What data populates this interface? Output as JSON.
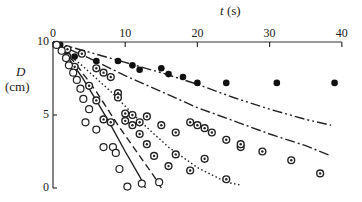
{
  "chart_data": {
    "type": "scatter",
    "title": "",
    "xlabel": "t (s)",
    "xlabel_var": "t",
    "xlabel_unit": "(s)",
    "ylabel": "D (cm)",
    "ylabel_var": "D",
    "ylabel_unit": "(cm)",
    "xlim": [
      0,
      40
    ],
    "ylim": [
      0,
      10
    ],
    "x_ticks": [
      0,
      10,
      20,
      30,
      40
    ],
    "y_ticks": [
      0,
      5,
      10
    ],
    "x_axis_position": "top",
    "grid": false,
    "legend": "none",
    "series": [
      {
        "name": "solid dots",
        "marker": "filled-circle",
        "points": [
          [
            1,
            9.8
          ],
          [
            3,
            9.0
          ],
          [
            6,
            8.7
          ],
          [
            9,
            8.7
          ],
          [
            11,
            8.4
          ],
          [
            12,
            8.1
          ],
          [
            15,
            8.2
          ],
          [
            16,
            7.8
          ],
          [
            18,
            7.6
          ],
          [
            20,
            7.2
          ],
          [
            24,
            7.2
          ],
          [
            31,
            7.2
          ],
          [
            39,
            7.2
          ]
        ]
      },
      {
        "name": "dotted-center circles (upper)",
        "marker": "dot-circle",
        "points": [
          [
            2,
            9.5
          ],
          [
            4,
            9.2
          ],
          [
            6,
            8.2
          ],
          [
            7,
            7.9
          ],
          [
            8,
            7.6
          ],
          [
            9,
            6.5
          ],
          [
            9,
            6.2
          ],
          [
            10,
            5.1
          ],
          [
            11,
            5.0
          ],
          [
            12,
            4.5
          ],
          [
            13,
            4.9
          ],
          [
            15,
            4.3
          ],
          [
            17,
            3.8
          ],
          [
            19,
            4.5
          ],
          [
            20,
            4.3
          ],
          [
            21,
            4.1
          ],
          [
            22,
            3.8
          ],
          [
            24,
            3.3
          ],
          [
            26,
            2.8
          ],
          [
            26,
            3.0
          ],
          [
            29,
            2.5
          ],
          [
            33,
            1.9
          ],
          [
            37,
            1.0
          ]
        ]
      },
      {
        "name": "dotted-center circles (lower)",
        "marker": "dot-circle",
        "points": [
          [
            2,
            9.0
          ],
          [
            3,
            8.3
          ],
          [
            5,
            7.0
          ],
          [
            6,
            6.0
          ],
          [
            7,
            4.7
          ],
          [
            8,
            4.5
          ],
          [
            10,
            4.6
          ],
          [
            11,
            4.3
          ],
          [
            12,
            3.7
          ],
          [
            13,
            3.0
          ],
          [
            14,
            2.2
          ],
          [
            16,
            1.5
          ],
          [
            17,
            2.3
          ],
          [
            19,
            1.2
          ],
          [
            21,
            2.0
          ],
          [
            24,
            0.6
          ]
        ]
      },
      {
        "name": "open circles",
        "marker": "open-circle",
        "points": [
          [
            0.5,
            9.8
          ],
          [
            1.2,
            9.4
          ],
          [
            1.8,
            8.9
          ],
          [
            2.2,
            8.4
          ],
          [
            2.8,
            7.9
          ],
          [
            3.3,
            7.4
          ],
          [
            3.8,
            6.8
          ],
          [
            4.2,
            6.1
          ],
          [
            5,
            5.4
          ],
          [
            4.5,
            4.5
          ],
          [
            6,
            4.0
          ],
          [
            7,
            2.8
          ],
          [
            8.3,
            2.8
          ],
          [
            8.7,
            2.4
          ],
          [
            9.2,
            1.3
          ],
          [
            10.3,
            0.1
          ],
          [
            12.3,
            0.3
          ],
          [
            14.7,
            0.4
          ]
        ]
      }
    ],
    "curves": [
      {
        "name": "solid line",
        "style": "solid",
        "points": [
          [
            0,
            10
          ],
          [
            2,
            9.0
          ],
          [
            4,
            7.6
          ],
          [
            6,
            6.0
          ],
          [
            8,
            4.3
          ],
          [
            10,
            2.5
          ],
          [
            12,
            0.8
          ],
          [
            12.8,
            0.0
          ]
        ]
      },
      {
        "name": "dashed line",
        "style": "dashed",
        "points": [
          [
            0,
            10
          ],
          [
            3,
            8.6
          ],
          [
            6,
            6.6
          ],
          [
            9,
            4.3
          ],
          [
            12,
            2.2
          ],
          [
            14,
            0.8
          ],
          [
            15,
            0.0
          ]
        ]
      },
      {
        "name": "dotted line",
        "style": "dotted",
        "points": [
          [
            0,
            10
          ],
          [
            4,
            8.4
          ],
          [
            8,
            6.6
          ],
          [
            12,
            4.6
          ],
          [
            16,
            2.8
          ],
          [
            20,
            1.4
          ],
          [
            24,
            0.4
          ],
          [
            26,
            0.2
          ]
        ]
      },
      {
        "name": "dash-dot line",
        "style": "dash-dot",
        "points": [
          [
            0,
            10
          ],
          [
            5,
            8.9
          ],
          [
            10,
            7.7
          ],
          [
            15,
            6.6
          ],
          [
            20,
            5.5
          ],
          [
            25,
            4.6
          ],
          [
            30,
            3.7
          ],
          [
            35,
            2.9
          ],
          [
            38.5,
            2.2
          ]
        ]
      },
      {
        "name": "dash-dot-dot line",
        "style": "dash-dot-dot",
        "points": [
          [
            0,
            10
          ],
          [
            5,
            9.3
          ],
          [
            10,
            8.6
          ],
          [
            15,
            7.9
          ],
          [
            20,
            7.1
          ],
          [
            25,
            6.2
          ],
          [
            30,
            5.4
          ],
          [
            35,
            4.7
          ],
          [
            38.5,
            4.3
          ]
        ]
      }
    ]
  }
}
